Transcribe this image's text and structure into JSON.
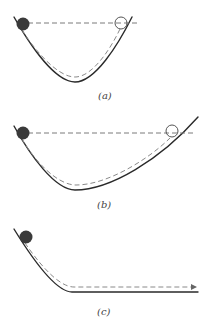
{
  "figure": {
    "panels": [
      {
        "id": "a",
        "label": "(a)",
        "description": "Ball released on symmetric U-shaped track rises to the same height on the other side"
      },
      {
        "id": "b",
        "label": "(b)",
        "description": "Ball released on track with shallower opposite slope travels farther to reach the same height"
      },
      {
        "id": "c",
        "label": "(c)",
        "description": "Ball released onto track that becomes horizontal continues moving indefinitely"
      }
    ]
  },
  "colors": {
    "track": "#2a2a2a",
    "dashed_path": "#8a8a8a",
    "ball": "#3a3a3a",
    "background": "#ffffff"
  }
}
